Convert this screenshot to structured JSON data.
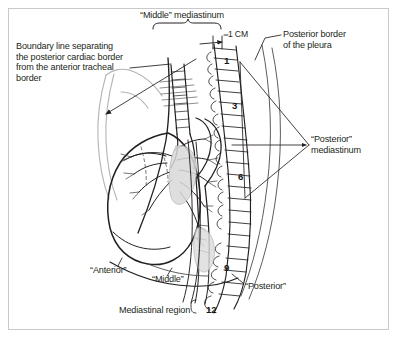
{
  "figure": {
    "type": "anatomical-illustration",
    "background_color": "#ffffff",
    "ink_color": "#231f20",
    "frame_color": "#c9c9c9"
  },
  "labels": {
    "boundary_note": "Boundary line separating\nthe posterior cardiac border\nfrom the anterior tracheal\nborder",
    "middle_mediastinum": "“Middle” mediastinum",
    "scale": "1 CM",
    "posterior_border_pleura": "Posterior border\nof the pleura",
    "posterior_mediastinum": "“Posterior”\nmediastinum",
    "anterior": "“Anterior”",
    "middle": "“Middle”",
    "posterior": "“Posterior”",
    "mediastinal_region": "Mediastinal region"
  },
  "vertebrae": {
    "marks": [
      {
        "number": "1"
      },
      {
        "number": "3"
      },
      {
        "number": "6"
      },
      {
        "number": "9"
      },
      {
        "number": "12"
      }
    ]
  }
}
